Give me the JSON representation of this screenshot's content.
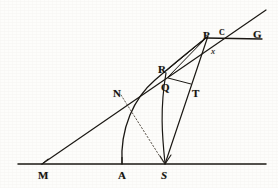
{
  "figure": {
    "width": 278,
    "height": 188,
    "background_color": "#fdfdfb",
    "ink_color": "#1a1713"
  },
  "labels": [
    {
      "id": "label-M",
      "text": "M",
      "x": 38,
      "y": 170,
      "style": "bold",
      "name": "point-label-m"
    },
    {
      "id": "label-A",
      "text": "A",
      "x": 118,
      "y": 170,
      "style": "bold",
      "name": "point-label-a"
    },
    {
      "id": "label-S",
      "text": "S",
      "x": 161,
      "y": 170,
      "style": "italic",
      "name": "point-label-s"
    },
    {
      "id": "label-N",
      "text": "N",
      "x": 113,
      "y": 88,
      "style": "bold",
      "name": "point-label-n"
    },
    {
      "id": "label-R",
      "text": "R",
      "x": 158,
      "y": 64,
      "style": "bold",
      "name": "point-label-r"
    },
    {
      "id": "label-Q",
      "text": "Q",
      "x": 161,
      "y": 82,
      "style": "bold",
      "name": "point-label-q"
    },
    {
      "id": "label-T",
      "text": "T",
      "x": 192,
      "y": 88,
      "style": "bold",
      "name": "point-label-t"
    },
    {
      "id": "label-P",
      "text": "P",
      "x": 203,
      "y": 30,
      "style": "bold",
      "name": "point-label-p"
    },
    {
      "id": "label-C",
      "text": "C",
      "x": 219,
      "y": 29,
      "style": "tiny",
      "name": "point-label-c"
    },
    {
      "id": "label-G",
      "text": "G",
      "x": 253,
      "y": 29,
      "style": "bold",
      "name": "point-label-g"
    },
    {
      "id": "label-x",
      "text": "x",
      "x": 211,
      "y": 47,
      "style": "italic-small",
      "name": "point-label-x"
    }
  ],
  "geometry": {
    "baseline": {
      "name": "baseline-MS",
      "x1": 18,
      "y1": 164,
      "x2": 266,
      "y2": 164
    },
    "oblique_line": {
      "name": "line-M-to-upper-right",
      "x1": 42,
      "y1": 164,
      "x2": 266,
      "y2": 10
    },
    "line_S_to_P": {
      "name": "line-S-through-T-to-P",
      "x1": 165,
      "y1": 164,
      "x2": 208,
      "y2": 37
    },
    "line_P_to_G": {
      "name": "line-P-to-G",
      "x1": 207,
      "y1": 38,
      "x2": 262,
      "y2": 39
    },
    "segment_Q_to_T": {
      "name": "segment-Q-to-T",
      "x1": 169,
      "y1": 78,
      "x2": 191,
      "y2": 83
    },
    "segment_Q_to_P": {
      "name": "segment-Q-to-P",
      "x1": 169,
      "y1": 77,
      "x2": 207,
      "y2": 37
    },
    "segment_R_to_P": {
      "name": "segment-R-to-P",
      "x1": 166,
      "y1": 72,
      "x2": 207,
      "y2": 38
    },
    "orbit_curve": {
      "name": "curve-A-through-Q-R-to-P",
      "start": [
        122,
        164
      ],
      "end": [
        207,
        37
      ]
    },
    "inner_curve": {
      "name": "curve-S-to-R",
      "start": [
        165,
        164
      ],
      "end": [
        167,
        71
      ]
    },
    "dotted_N_to_S": {
      "name": "dotted-line-N-to-S",
      "x1": 122,
      "y1": 94,
      "x2": 165,
      "y2": 163
    },
    "tick_A": {
      "name": "tick-mark-a",
      "x": 122,
      "y1": 158,
      "y2": 164
    },
    "tick_S": {
      "name": "tick-mark-s",
      "x": 165,
      "y1": 158,
      "y2": 164
    }
  }
}
